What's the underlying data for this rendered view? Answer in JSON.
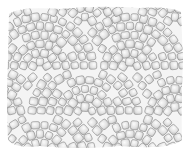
{
  "image": {
    "subject": "Pencil sketch of cobblestone paving laid in overlapping fan (arc) patterns",
    "width": 189,
    "height": 160,
    "background": "#ffffff",
    "stone_fill_light": "#f2f2f2",
    "stone_fill_mid": "#d9d9d9",
    "stone_shadow": "#b8b8b8",
    "stone_outline": "#8a8a8a",
    "joint_color": "#c8c8c8",
    "paved_area": {
      "x": 7,
      "y": 8,
      "w": 175,
      "h": 140
    },
    "fans": [
      {
        "cx": 40,
        "cy": 70,
        "radii": [
          8,
          17,
          26,
          35,
          44,
          53
        ]
      },
      {
        "cx": 130,
        "cy": 70,
        "radii": [
          8,
          17,
          26,
          35,
          44,
          53
        ]
      },
      {
        "cx": 85,
        "cy": 115,
        "radii": [
          8,
          17,
          26,
          35,
          44,
          53
        ]
      },
      {
        "cx": 175,
        "cy": 115,
        "radii": [
          8,
          17,
          26,
          35,
          44,
          53
        ]
      },
      {
        "cx": -5,
        "cy": 115,
        "radii": [
          8,
          17,
          26,
          35,
          44,
          53
        ]
      },
      {
        "cx": 85,
        "cy": 25,
        "radii": [
          8,
          17,
          26,
          35,
          44,
          53
        ]
      },
      {
        "cx": 175,
        "cy": 25,
        "radii": [
          8,
          17,
          26,
          35,
          44,
          53
        ]
      },
      {
        "cx": -5,
        "cy": 25,
        "radii": [
          8,
          17,
          26,
          35,
          44,
          53
        ]
      },
      {
        "cx": 40,
        "cy": 160,
        "radii": [
          8,
          17,
          26,
          35,
          44,
          53
        ]
      },
      {
        "cx": 130,
        "cy": 160,
        "radii": [
          8,
          17,
          26,
          35,
          44,
          53
        ]
      }
    ],
    "stone_size": 8
  }
}
